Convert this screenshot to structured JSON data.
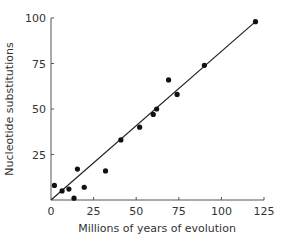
{
  "chart_data": {
    "type": "scatter",
    "title": "",
    "xlabel": "Millions of years of evolution",
    "ylabel": "Nucleotide substitutions",
    "xlim": [
      0,
      125
    ],
    "ylim": [
      0,
      100
    ],
    "x_ticks": [
      0,
      25,
      50,
      75,
      100,
      125
    ],
    "y_ticks": [
      25,
      50,
      75,
      100
    ],
    "x_tick_labels": [
      "0",
      "25",
      "50",
      "75",
      "100",
      "125"
    ],
    "y_tick_labels": [
      "25",
      "50",
      "75",
      "100"
    ],
    "grid": false,
    "legend": null,
    "series": [
      {
        "name": "observations",
        "points": [
          {
            "x": 2,
            "y": 8
          },
          {
            "x": 6.5,
            "y": 5
          },
          {
            "x": 10.5,
            "y": 6
          },
          {
            "x": 13.5,
            "y": 1
          },
          {
            "x": 15.5,
            "y": 17
          },
          {
            "x": 19.5,
            "y": 7
          },
          {
            "x": 32,
            "y": 16
          },
          {
            "x": 41,
            "y": 33
          },
          {
            "x": 52,
            "y": 40
          },
          {
            "x": 60,
            "y": 47
          },
          {
            "x": 62,
            "y": 50
          },
          {
            "x": 69,
            "y": 66
          },
          {
            "x": 74,
            "y": 58
          },
          {
            "x": 90,
            "y": 74
          },
          {
            "x": 120,
            "y": 98
          }
        ]
      }
    ],
    "trendline": {
      "from": {
        "x": 0,
        "y": 0
      },
      "to": {
        "x": 120,
        "y": 98
      }
    },
    "colors": {
      "points": "#111111",
      "line": "#222222",
      "axis": "#555555",
      "text": "#333333"
    }
  }
}
